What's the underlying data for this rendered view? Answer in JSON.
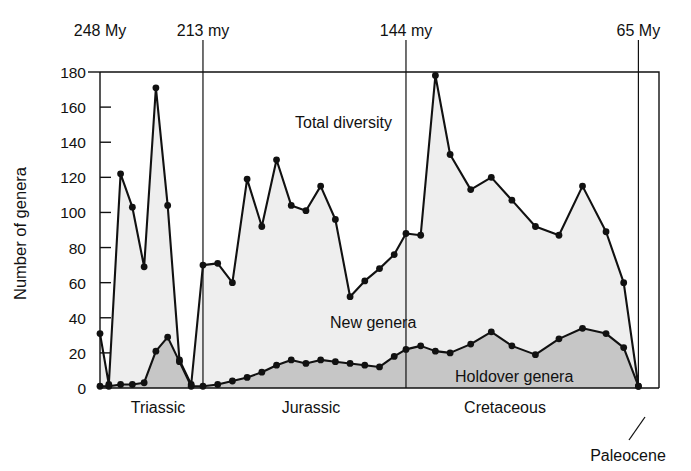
{
  "figure": {
    "axis_title_y": "Number of genera",
    "top_axis_labels": [
      {
        "text": "248 My",
        "value": 248
      },
      {
        "text": "213 my",
        "value": 213
      },
      {
        "text": "144 my",
        "value": 144
      },
      {
        "text": "65 My",
        "value": 65
      }
    ],
    "annotations": [
      {
        "name": "total-diversity",
        "text": "Total diversity"
      },
      {
        "name": "new-genera",
        "text": "New genera"
      },
      {
        "name": "holdover-genera",
        "text": "Holdover genera"
      },
      {
        "name": "paleocene",
        "text": "Paleocene"
      }
    ],
    "period_labels": [
      {
        "text": "Triassic"
      },
      {
        "text": "Jurassic"
      },
      {
        "text": "Cretaceous"
      }
    ],
    "colors": {
      "ink": "#111111",
      "total_fill": "#eeeeee",
      "holdover_fill": "#c6c6c6",
      "background": "#ffffff"
    }
  },
  "chart_data": {
    "type": "area",
    "title": "",
    "subtitle": "",
    "xlabel": "",
    "ylabel": "Number of genera",
    "ylim": [
      0,
      180
    ],
    "yticks": [
      0,
      20,
      40,
      60,
      80,
      100,
      120,
      140,
      160,
      180
    ],
    "ytick_labels": [
      "0",
      "20",
      "40",
      "60",
      "80",
      "100",
      "120",
      "140",
      "160",
      "180"
    ],
    "grid": false,
    "legend_position": "in-plot-annotations",
    "x_axis": {
      "unit": "millions of years ago (Ma)",
      "direction": "older-to-younger left-to-right",
      "range": [
        248,
        58
      ],
      "boundaries": [
        {
          "label": "248 My",
          "value": 248
        },
        {
          "label": "213 my",
          "value": 213
        },
        {
          "label": "144 my",
          "value": 144
        },
        {
          "label": "65 My",
          "value": 65
        }
      ]
    },
    "periods": [
      {
        "name": "Triassic",
        "start": 248,
        "end": 213
      },
      {
        "name": "Jurassic",
        "start": 213,
        "end": 144
      },
      {
        "name": "Cretaceous",
        "start": 144,
        "end": 65
      },
      {
        "name": "Paleocene",
        "start": 65,
        "end": 58
      }
    ],
    "series": [
      {
        "name": "Total diversity",
        "fill": "#eeeeee",
        "values": [
          31,
          2,
          122,
          103,
          69,
          171,
          104,
          16,
          2,
          70,
          71,
          60,
          119,
          92,
          130,
          104,
          101,
          115,
          96,
          52,
          61,
          68,
          76,
          88,
          87,
          178,
          133,
          113,
          120,
          107,
          92,
          87,
          115,
          89,
          60,
          1
        ]
      },
      {
        "name": "Holdover genera",
        "fill": "#c6c6c6",
        "values": [
          1,
          1,
          2,
          2,
          3,
          21,
          29,
          15,
          1,
          1,
          2,
          4,
          6,
          9,
          13,
          16,
          14,
          16,
          15,
          14,
          13,
          12,
          18,
          22,
          24,
          21,
          20,
          25,
          32,
          24,
          19,
          28,
          34,
          31,
          23,
          1
        ]
      }
    ],
    "x_values": [
      248,
      245,
      241,
      237,
      233,
      229,
      225,
      221,
      217,
      213,
      208,
      203,
      198,
      193,
      188,
      183,
      178,
      173,
      168,
      163,
      158,
      153,
      148,
      144,
      139,
      134,
      129,
      122,
      115,
      108,
      100,
      92,
      84,
      76,
      70,
      65
    ]
  }
}
